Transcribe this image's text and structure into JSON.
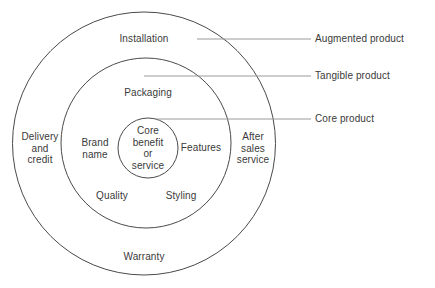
{
  "diagram": {
    "background_color": "#ffffff",
    "stroke_color": "#4a4a4a",
    "text_color": "#3a3a3a",
    "leader_line_color": "#9a9a9a",
    "rings": {
      "outer": {
        "name": "Augmented product",
        "labels": {
          "top": "Installation",
          "left": "Delivery\nand\ncredit",
          "right": "After\nsales\nservice",
          "bottom": "Warranty"
        }
      },
      "middle": {
        "name": "Tangible product",
        "labels": {
          "top": "Packaging",
          "left": "Brand\nname",
          "right": "Features",
          "bottom_left": "Quality",
          "bottom_right": "Styling"
        }
      },
      "inner": {
        "name": "Core product",
        "labels": {
          "center": "Core\nbenefit\nor\nservice"
        }
      }
    },
    "callouts": [
      {
        "label": "Augmented product",
        "ring": "outer"
      },
      {
        "label": "Tangible product",
        "ring": "middle"
      },
      {
        "label": "Core product",
        "ring": "inner"
      }
    ]
  }
}
